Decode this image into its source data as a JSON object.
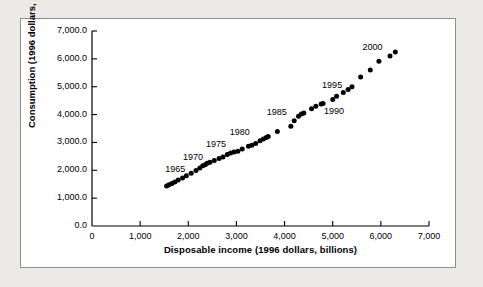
{
  "chart_data": {
    "type": "scatter",
    "title": "",
    "xlabel": "Disposable income (1996 dollars, billions)",
    "ylabel": "Consumption (1996 dollars, billions)",
    "xlim": [
      0,
      7000
    ],
    "ylim": [
      0,
      7000
    ],
    "xticks": [
      0,
      1000,
      2000,
      3000,
      4000,
      5000,
      6000,
      7000
    ],
    "yticks": [
      0,
      1000,
      2000,
      3000,
      4000,
      5000,
      6000,
      7000
    ],
    "xtick_labels": [
      "0",
      "1,000",
      "2,000",
      "3,000",
      "4,000",
      "5,000",
      "6,000",
      "7,000"
    ],
    "ytick_labels": [
      "0.0",
      "1,000.0",
      "2,000.0",
      "3,000.0",
      "4,000.0",
      "5,000.0",
      "6,000.0",
      "7,000.0"
    ],
    "grid": false,
    "legend": null,
    "marker": "filled-circle",
    "marker_color": "#000000",
    "points": [
      {
        "x": 1550,
        "y": 1440
      },
      {
        "x": 1600,
        "y": 1480
      },
      {
        "x": 1660,
        "y": 1530
      },
      {
        "x": 1720,
        "y": 1580
      },
      {
        "x": 1790,
        "y": 1650
      },
      {
        "x": 1880,
        "y": 1720
      },
      {
        "x": 1960,
        "y": 1800
      },
      {
        "x": 2060,
        "y": 1890
      },
      {
        "x": 2160,
        "y": 1990
      },
      {
        "x": 2240,
        "y": 2080
      },
      {
        "x": 2300,
        "y": 2160
      },
      {
        "x": 2350,
        "y": 2200
      },
      {
        "x": 2390,
        "y": 2250
      },
      {
        "x": 2450,
        "y": 2290
      },
      {
        "x": 2540,
        "y": 2350
      },
      {
        "x": 2640,
        "y": 2420
      },
      {
        "x": 2720,
        "y": 2480
      },
      {
        "x": 2810,
        "y": 2570
      },
      {
        "x": 2880,
        "y": 2620
      },
      {
        "x": 2950,
        "y": 2660
      },
      {
        "x": 3030,
        "y": 2680
      },
      {
        "x": 3120,
        "y": 2760
      },
      {
        "x": 3250,
        "y": 2860
      },
      {
        "x": 3320,
        "y": 2900
      },
      {
        "x": 3400,
        "y": 2960
      },
      {
        "x": 3490,
        "y": 3060
      },
      {
        "x": 3560,
        "y": 3120
      },
      {
        "x": 3620,
        "y": 3180
      },
      {
        "x": 3660,
        "y": 3210
      },
      {
        "x": 3850,
        "y": 3390
      },
      {
        "x": 4130,
        "y": 3580
      },
      {
        "x": 4200,
        "y": 3780
      },
      {
        "x": 4290,
        "y": 3940
      },
      {
        "x": 4350,
        "y": 4020
      },
      {
        "x": 4400,
        "y": 4060
      },
      {
        "x": 4560,
        "y": 4210
      },
      {
        "x": 4650,
        "y": 4300
      },
      {
        "x": 4760,
        "y": 4380
      },
      {
        "x": 4800,
        "y": 4400
      },
      {
        "x": 5000,
        "y": 4540
      },
      {
        "x": 5080,
        "y": 4660
      },
      {
        "x": 5220,
        "y": 4790
      },
      {
        "x": 5320,
        "y": 4900
      },
      {
        "x": 5400,
        "y": 5000
      },
      {
        "x": 5580,
        "y": 5350
      },
      {
        "x": 5780,
        "y": 5600
      },
      {
        "x": 5960,
        "y": 5910
      },
      {
        "x": 6190,
        "y": 6100
      },
      {
        "x": 6300,
        "y": 6250
      }
    ],
    "annotations": [
      {
        "text": "1965",
        "x": 1790,
        "y": 2000
      },
      {
        "text": "1970",
        "x": 2160,
        "y": 2430
      },
      {
        "text": "1975",
        "x": 2640,
        "y": 2900
      },
      {
        "text": "1980",
        "x": 3130,
        "y": 3330
      },
      {
        "text": "1985",
        "x": 3900,
        "y": 4050
      },
      {
        "text": "1990",
        "x": 5090,
        "y": 4080
      },
      {
        "text": "1995",
        "x": 5050,
        "y": 5040
      },
      {
        "text": "2000",
        "x": 5890,
        "y": 6400
      }
    ]
  }
}
